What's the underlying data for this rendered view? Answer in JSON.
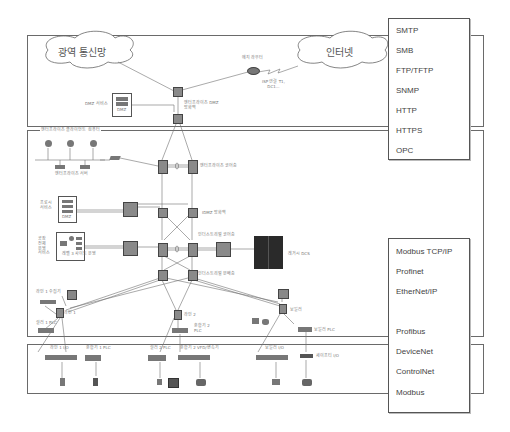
{
  "diagram": {
    "zones": {
      "dmz_zone": {
        "label": ""
      },
      "enterprise_zone": {
        "label": "엔터프라이즈 클라이언트 컴퓨터"
      },
      "field_zone": {
        "label": ""
      }
    },
    "clouds": {
      "wan": "광역 통신망",
      "internet": "인터넷"
    },
    "labels": {
      "edge_router": "에지 라우터",
      "isp": "ISP 연결 T1,\nDC1...",
      "dmz_service": "DMZ 서비스",
      "dmz": "DMZ",
      "enterprise_dmz_fw": "엔터프라이즈 DMZ\n방화벽",
      "enterprise_servers": "엔터프라이즈 서버",
      "enterprise_core": "엔터프라이즈 코어층",
      "proxy_service": "프로시\n서비스",
      "dmz2": "DMZ",
      "idmz_fw": "IDMZ 방화벽",
      "industrial_core": "인더스트리얼 코어층",
      "industrial_dist": "인더스트리얼 분배층",
      "plant_ops": "공장\n전체\n운영\n서비스",
      "level3_site_ops": "레벨 3 사이트 운영",
      "legacy_dcs": "레거시 DCS",
      "line1_collector": "라인 1 수집기",
      "line1": "라인 1",
      "line2": "라인 2",
      "line1_plc": "컬러 1 PLC",
      "mixer2_plc": "혼합기 2\nPLC",
      "boiler": "보일러",
      "boiler_plc": "보일러 PLC",
      "line1_io": "라인 1 I/O",
      "mixer1_plc": "혼합기 1 PLC",
      "color2_plc": "컬러 2 PLC",
      "mixer2_vfd": "혼합기 2 VFD/변속기",
      "boiler_io": "보일러 I/O",
      "tank_io": "세이프티 I/O"
    },
    "protocols_upper": [
      "SMTP",
      "SMB",
      "FTP/TFTP",
      "SNMP",
      "HTTP",
      "HTTPS",
      "OPC"
    ],
    "protocols_lower": [
      "Modbus TCP/IP",
      "Profinet",
      "EtherNet/IP",
      "",
      "Profibus",
      "DeviceNet",
      "ControlNet",
      "Modbus"
    ]
  },
  "colors": {
    "border": "#6a6a6a",
    "line": "#707070",
    "device": "#8a8a8a",
    "dcs": "#2a2a2a"
  }
}
